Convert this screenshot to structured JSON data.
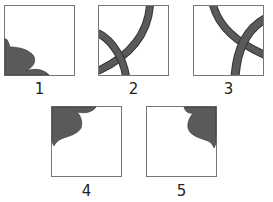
{
  "figure": {
    "colors": {
      "fill": "#5a5a5a",
      "border": "#777777",
      "background": "#ffffff",
      "label": "#222222"
    },
    "panels": [
      {
        "id": 1,
        "label": "1",
        "content": "petal/lobe shape in bottom-left corner"
      },
      {
        "id": 2,
        "label": "2",
        "content": "two crossing thick arcs, bottom-left region"
      },
      {
        "id": 3,
        "label": "3",
        "content": "two crossing thick arcs, right region"
      },
      {
        "id": 4,
        "label": "4",
        "content": "petal/lobe shape in top-left corner"
      },
      {
        "id": 5,
        "label": "5",
        "content": "petal/lobe shape in top-right corner"
      }
    ]
  }
}
